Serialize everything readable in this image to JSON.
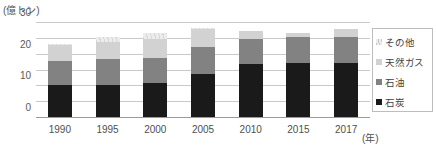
{
  "chart": {
    "unit_label": "(億トン)",
    "xaxis_unit": "(年)"
  },
  "chart_data": {
    "type": "bar",
    "title": "",
    "subtitle": "",
    "xlabel": "(年)",
    "ylabel": "(億トン)",
    "ylim": [
      0,
      60
    ],
    "yticks": [
      0,
      10,
      20,
      30,
      40,
      50,
      60
    ],
    "ytick_labels": [
      "0",
      "10",
      "20",
      "30",
      "40",
      "50",
      "60"
    ],
    "grid": true,
    "stacked": true,
    "legend_position": "right",
    "categories": [
      "1990",
      "1995",
      "2000",
      "2005",
      "2010",
      "2015",
      "2017"
    ],
    "series": [
      {
        "name": "石炭",
        "color": "#1a1a1a",
        "values": [
          21,
          21,
          22,
          28,
          34,
          35,
          35
        ]
      },
      {
        "name": "石油",
        "color": "#828282",
        "values": [
          15,
          16,
          16,
          17,
          16,
          16,
          16
        ]
      },
      {
        "name": "天然ガス",
        "color": "#d2d2d2",
        "values": [
          10,
          11,
          12,
          11,
          5,
          3,
          5
        ]
      },
      {
        "name": "その他",
        "color": "#ececec",
        "values": [
          1,
          3,
          4,
          1,
          0,
          0,
          0
        ]
      }
    ],
    "totals": [
      47,
      51,
      54,
      57,
      55,
      54,
      56
    ]
  },
  "legend": {
    "items": [
      {
        "label": "その他"
      },
      {
        "label": "天然ガス"
      },
      {
        "label": "石油"
      },
      {
        "label": "石炭"
      }
    ]
  }
}
